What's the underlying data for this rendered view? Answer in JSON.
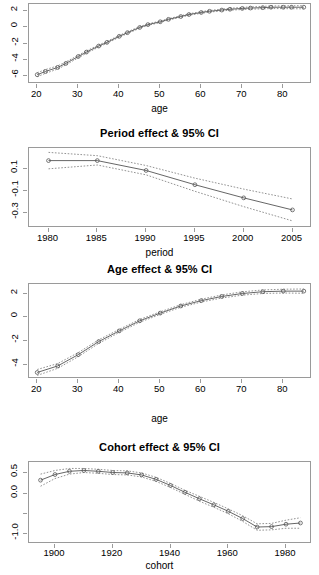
{
  "figure": {
    "kind": "apc-effects-panels",
    "panel_count": 4,
    "line_color": "#555555",
    "marker_color": "#555555",
    "ci_color": "#777777",
    "frame_color": "#9a9a9a",
    "background": "#ffffff"
  },
  "chart_data": [
    {
      "type": "line",
      "panel_index": 0,
      "title": "",
      "title_visible": false,
      "xlabel": "age",
      "ylabel": "",
      "xlim": [
        18,
        87
      ],
      "ylim": [
        -7.0,
        2.9
      ],
      "xticks": [
        20,
        30,
        40,
        50,
        60,
        70,
        80
      ],
      "yticks": [
        2,
        0,
        -2,
        -4,
        -6
      ],
      "ytick_labels": [
        "2",
        "0",
        "-2",
        "-4",
        "-6"
      ],
      "grid": false,
      "legend": "none",
      "has_ci": true,
      "ci_level": "95%",
      "marker": "open-circle",
      "x": [
        20,
        22,
        25,
        27,
        30,
        32,
        35,
        37,
        40,
        42,
        45,
        47,
        50,
        52,
        55,
        57,
        60,
        62,
        65,
        67,
        70,
        72,
        75,
        77,
        80,
        82,
        85
      ],
      "y": [
        -5.85,
        -5.45,
        -4.95,
        -4.45,
        -3.6,
        -3.05,
        -2.3,
        -1.85,
        -1.1,
        -0.65,
        0.0,
        0.35,
        0.7,
        1.0,
        1.35,
        1.6,
        1.85,
        2.0,
        2.15,
        2.25,
        2.35,
        2.4,
        2.45,
        2.5,
        2.5,
        2.5,
        2.5
      ],
      "ci_lower": [
        -6.1,
        -5.68,
        -5.15,
        -4.63,
        -3.76,
        -3.2,
        -2.43,
        -1.97,
        -1.21,
        -0.76,
        -0.1,
        0.26,
        0.61,
        0.91,
        1.26,
        1.51,
        1.75,
        1.9,
        2.04,
        2.13,
        2.22,
        2.26,
        2.3,
        2.34,
        2.33,
        2.32,
        2.3
      ],
      "ci_upper": [
        -5.6,
        -5.22,
        -4.75,
        -4.27,
        -3.44,
        -2.9,
        -2.17,
        -1.73,
        -0.99,
        -0.54,
        0.1,
        0.44,
        0.79,
        1.09,
        1.44,
        1.69,
        1.95,
        2.1,
        2.26,
        2.37,
        2.48,
        2.54,
        2.6,
        2.66,
        2.67,
        2.68,
        2.7
      ]
    },
    {
      "type": "line",
      "panel_index": 1,
      "title": "Period effect & 95% CI",
      "title_visible": true,
      "xlabel": "period",
      "ylabel": "",
      "xlim": [
        1978,
        2007
      ],
      "ylim": [
        -0.44,
        0.29
      ],
      "xticks": [
        1980,
        1985,
        1990,
        1995,
        2000,
        2005
      ],
      "yticks": [
        0.1,
        -0.1,
        -0.3
      ],
      "ytick_labels": [
        "0.1",
        "-0.1",
        "-0.3"
      ],
      "grid": false,
      "legend": "none",
      "has_ci": true,
      "ci_level": "95%",
      "marker": "open-circle",
      "x": [
        1980,
        1985,
        1990,
        1995,
        2000,
        2005
      ],
      "y": [
        0.175,
        0.175,
        0.085,
        -0.045,
        -0.165,
        -0.275
      ],
      "ci_lower": [
        0.1,
        0.135,
        0.045,
        -0.105,
        -0.245,
        -0.375
      ],
      "ci_upper": [
        0.25,
        0.22,
        0.13,
        0.015,
        -0.085,
        -0.175
      ]
    },
    {
      "type": "line",
      "panel_index": 2,
      "title": "Age effect & 95% CI",
      "title_visible": true,
      "xlabel": "age",
      "ylabel": "",
      "xlim": [
        18,
        87
      ],
      "ylim": [
        -5.2,
        2.8
      ],
      "xticks": [
        20,
        30,
        40,
        50,
        60,
        70,
        80
      ],
      "yticks": [
        2,
        0,
        -2,
        -4
      ],
      "ytick_labels": [
        "2",
        "0",
        "-2",
        "-4"
      ],
      "grid": false,
      "legend": "none",
      "has_ci": true,
      "ci_level": "95%",
      "marker": "open-circle",
      "x": [
        20,
        25,
        30,
        35,
        40,
        45,
        50,
        55,
        60,
        65,
        70,
        75,
        80,
        85
      ],
      "y": [
        -4.65,
        -4.1,
        -3.15,
        -2.05,
        -1.15,
        -0.3,
        0.35,
        0.95,
        1.4,
        1.75,
        2.0,
        2.15,
        2.2,
        2.2
      ],
      "ci_lower": [
        -4.9,
        -4.3,
        -3.32,
        -2.2,
        -1.28,
        -0.42,
        0.24,
        0.84,
        1.28,
        1.62,
        1.86,
        2.0,
        2.04,
        2.02
      ],
      "ci_upper": [
        -4.4,
        -3.9,
        -2.98,
        -1.9,
        -1.02,
        -0.18,
        0.46,
        1.06,
        1.52,
        1.88,
        2.14,
        2.3,
        2.36,
        2.38
      ]
    },
    {
      "type": "line",
      "panel_index": 3,
      "title": "Cohort effect & 95% CI",
      "title_visible": true,
      "xlabel": "cohort",
      "ylabel": "",
      "xlim": [
        1891,
        1989
      ],
      "ylim": [
        -1.25,
        0.78
      ],
      "xticks": [
        1900,
        1920,
        1940,
        1960,
        1980
      ],
      "yticks": [
        0.5,
        0.0,
        -0.5,
        -1.0
      ],
      "ytick_labels": [
        "0.5",
        "0.0",
        "",
        "-1.0"
      ],
      "grid": false,
      "legend": "none",
      "has_ci": true,
      "ci_level": "95%",
      "marker": "open-circle",
      "x": [
        1895,
        1900,
        1905,
        1910,
        1915,
        1920,
        1925,
        1930,
        1935,
        1940,
        1945,
        1950,
        1955,
        1960,
        1965,
        1970,
        1975,
        1980,
        1985
      ],
      "y": [
        0.33,
        0.47,
        0.55,
        0.57,
        0.55,
        0.52,
        0.51,
        0.46,
        0.35,
        0.2,
        0.03,
        -0.13,
        -0.28,
        -0.44,
        -0.62,
        -0.83,
        -0.82,
        -0.76,
        -0.73
      ],
      "ci_lower": [
        0.18,
        0.37,
        0.48,
        0.52,
        0.5,
        0.47,
        0.46,
        0.41,
        0.3,
        0.15,
        -0.02,
        -0.19,
        -0.34,
        -0.5,
        -0.69,
        -0.91,
        -0.9,
        -0.86,
        -0.86
      ],
      "ci_upper": [
        0.48,
        0.57,
        0.62,
        0.62,
        0.6,
        0.57,
        0.56,
        0.51,
        0.4,
        0.25,
        0.08,
        -0.07,
        -0.22,
        -0.38,
        -0.55,
        -0.75,
        -0.74,
        -0.66,
        -0.6
      ]
    }
  ]
}
